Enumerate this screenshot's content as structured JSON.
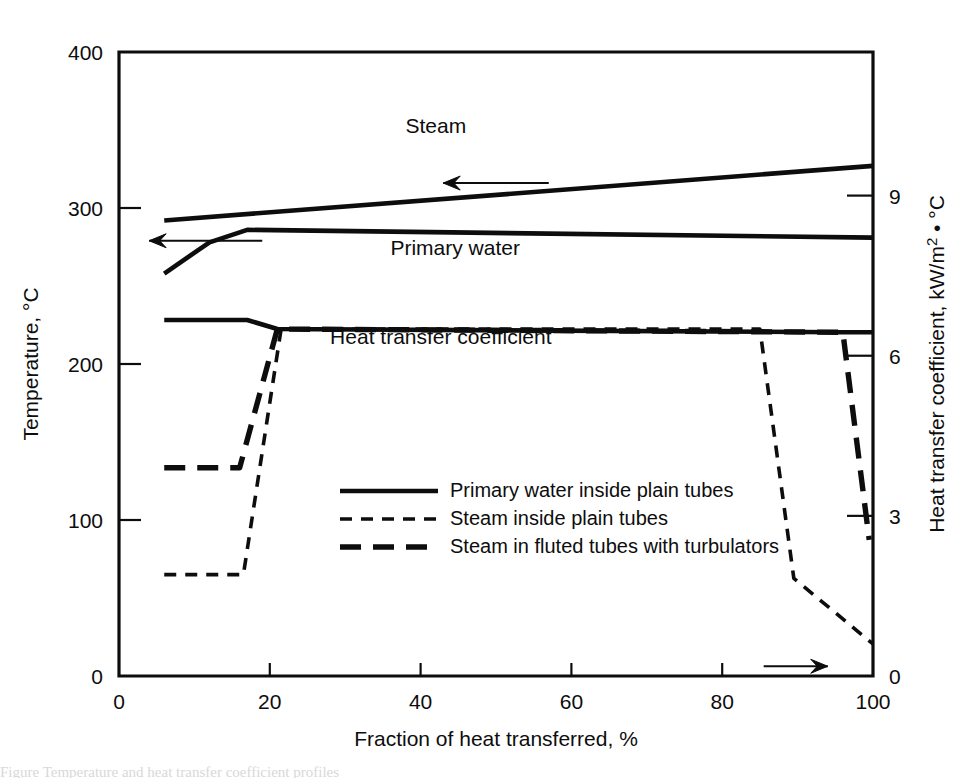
{
  "figure": {
    "background_color": "#ffffff",
    "ink_color": "#0d0d0d",
    "caption_partial": "Figure  Temperature and heat transfer coefficient profiles"
  },
  "chart_data": {
    "type": "line",
    "title": "",
    "xlabel": "Fraction of heat transferred, %",
    "ylabel": "Temperature, °C",
    "y2label": "Heat transfer coefficient, kW/m² • °C",
    "xlim": [
      0,
      100
    ],
    "ylim": [
      0,
      400
    ],
    "y2lim": [
      0,
      11.69
    ],
    "xticks": [
      0,
      20,
      40,
      60,
      80,
      100
    ],
    "xticklabels": [
      "0",
      "20",
      "40",
      "60",
      "80",
      "100"
    ],
    "yticks": [
      0,
      100,
      200,
      300,
      400
    ],
    "yticklabels": [
      "0",
      "100",
      "200",
      "300",
      "400"
    ],
    "y2ticks": [
      0,
      3,
      6,
      9
    ],
    "y2ticklabels": [
      "0",
      "3",
      "6",
      "9"
    ],
    "grid": false,
    "legend_position": "center",
    "series": [
      {
        "name": "Primary water inside plain tubes",
        "style": "solid",
        "axis": "left",
        "role": "temperature-primary-water",
        "x": [
          6,
          12,
          17,
          100
        ],
        "y": [
          258,
          278,
          286,
          281
        ]
      },
      {
        "name": "Steam temperature",
        "style": "solid",
        "axis": "left",
        "role": "temperature-steam",
        "x": [
          6,
          100
        ],
        "y": [
          292,
          327
        ]
      },
      {
        "name": "Heat transfer coefficient, primary water inside plain tubes",
        "style": "solid",
        "axis": "right",
        "role": "htc-primary-water",
        "x": [
          6,
          17,
          21,
          96,
          100
        ],
        "y": [
          6.67,
          6.67,
          6.5,
          6.44,
          6.44
        ]
      },
      {
        "name": "Steam inside plain tubes",
        "style": "shortdash",
        "axis": "right",
        "role": "htc-steam-plain",
        "x": [
          6,
          16.5,
          21.5,
          85,
          89.5,
          100
        ],
        "y": [
          1.9,
          1.9,
          6.5,
          6.5,
          1.83,
          0.6
        ]
      },
      {
        "name": "Steam in fluted tubes with turbulators",
        "style": "longdash",
        "axis": "right",
        "role": "htc-steam-fluted",
        "x": [
          6,
          16,
          21,
          96,
          99.5
        ],
        "y": [
          3.9,
          3.9,
          6.5,
          6.44,
          2.55
        ]
      }
    ],
    "annotations": [
      {
        "text": "Steam",
        "x": 38,
        "y": 348,
        "axis": "left",
        "role": "steam-curve-label"
      },
      {
        "text": "Primary water",
        "x": 36,
        "y": 270,
        "axis": "left",
        "role": "primary-water-curve-label"
      },
      {
        "text": "Heat transfer coefficient",
        "x": 28,
        "y": 213,
        "axis": "left",
        "role": "htc-curve-label"
      }
    ],
    "arrows": [
      {
        "role": "steam-to-left-axis",
        "direction": "left",
        "from_x": 57,
        "from_y": 316,
        "to_x": 43,
        "to_y": 316
      },
      {
        "role": "primary-water-to-left-axis",
        "direction": "left",
        "from_x": 19,
        "from_y": 279,
        "to_x": 4,
        "to_y": 279
      },
      {
        "role": "htc-to-right-axis",
        "direction": "right",
        "from_x": 85.5,
        "from_y": 6.23,
        "to_x": 94,
        "to_y": 6.23
      }
    ],
    "legend_entries": [
      {
        "label": "Primary water inside plain tubes",
        "style": "solid"
      },
      {
        "label": "Steam inside plain tubes",
        "style": "shortdash"
      },
      {
        "label": "Steam in fluted tubes with turbulators",
        "style": "longdash"
      }
    ]
  }
}
